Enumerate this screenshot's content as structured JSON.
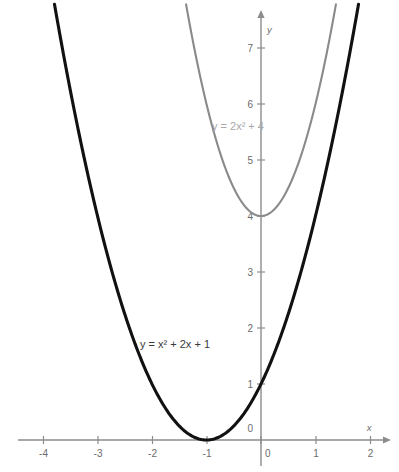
{
  "chart_data": {
    "type": "line",
    "title": "",
    "subtitle": "",
    "xlabel": "x",
    "ylabel": "y",
    "xlim": [
      -4.78,
      2.35
    ],
    "ylim": [
      -0.55,
      7.78
    ],
    "grid": false,
    "legend_position": "inline-annotation",
    "x_ticks": [
      -4,
      -3,
      -2,
      -1,
      0,
      1,
      2
    ],
    "x_tick_labels": [
      "-4",
      "-3",
      "-2",
      "-1",
      "0",
      "1",
      "2"
    ],
    "y_ticks": [
      0,
      1,
      2,
      3,
      4,
      5,
      6,
      7
    ],
    "y_tick_labels": [
      "0",
      "1",
      "2",
      "3",
      "4",
      "5",
      "6",
      "7"
    ],
    "series": [
      {
        "name": "y = x² + 2x + 1",
        "label": "y = x² + 2x + 1",
        "color": "#111111",
        "equation": "y = x^2 + 2x + 1",
        "vertex": [
          -1,
          0
        ],
        "y_intercept": 1,
        "coefficients": {
          "a": 1,
          "b": 2,
          "c": 1
        },
        "x": [
          -4.7,
          -4.5,
          -4,
          -3.5,
          -3,
          -2.5,
          -2,
          -1.5,
          -1,
          -0.5,
          0,
          0.5,
          1,
          1.5,
          1.72
        ],
        "values": [
          13.69,
          12.25,
          9,
          6.25,
          4,
          2.25,
          1,
          0.25,
          0,
          0.25,
          1,
          2.25,
          4,
          6.25,
          7.4
        ]
      },
      {
        "name": "y = 2x² + 4",
        "label": "y = 2x² + 4",
        "color": "#8a8a8a",
        "equation": "y = 2x^2 + 4",
        "vertex": [
          0,
          4
        ],
        "y_intercept": 4,
        "coefficients": {
          "a": 2,
          "b": 0,
          "c": 4
        },
        "x": [
          -1.36,
          -1.2,
          -1,
          -0.8,
          -0.6,
          -0.4,
          -0.2,
          0,
          0.2,
          0.4,
          0.6,
          0.8,
          1,
          1.2,
          1.36
        ],
        "values": [
          7.7,
          6.88,
          6,
          5.28,
          4.72,
          4.32,
          4.08,
          4,
          4.08,
          4.32,
          4.72,
          5.28,
          6,
          6.88,
          7.7
        ]
      }
    ]
  },
  "annotations": {
    "primary_label": "y = x² + 2x + 1",
    "secondary_label": "y = 2x² + 4"
  },
  "axes": {
    "x_axis_name": "x",
    "y_axis_name": "y",
    "origin_label_x": "0",
    "origin_label_y": "0"
  },
  "colors": {
    "primary_curve": "#111111",
    "secondary_curve": "#8a8a8a",
    "axis": "#8c8c8c",
    "tick_text": "#6b6b6b",
    "background": "#ffffff"
  }
}
